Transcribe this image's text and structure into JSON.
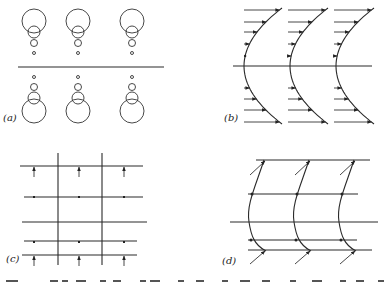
{
  "figure": {
    "panels": [
      {
        "id": "a",
        "label": "(a)",
        "description": "Three columns of stacked circles shrinking toward a central horizontal line, mirrored above and below",
        "columns": 3
      },
      {
        "id": "b",
        "label": "(b)",
        "description": "Three parabolic velocity profiles with horizontal arrows whose length grows away from the central line",
        "columns": 3
      },
      {
        "id": "c",
        "label": "(c)",
        "description": "Grid of horizontal and vertical lines with upward arrows on outer rows and small dots on inner rows",
        "columns": 3
      },
      {
        "id": "d",
        "label": "(d)",
        "description": "Three curved flow lines crossing horizontal lines with oblique arrows at top and bottom",
        "columns": 3
      }
    ],
    "caption_partial": "(The caption text is cropped at the bottom edge)"
  }
}
